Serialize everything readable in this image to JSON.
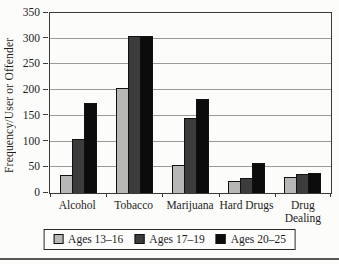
{
  "chart_data": {
    "type": "bar",
    "title": "",
    "ylabel": "Frequency/User or Offender",
    "xlabel": "",
    "ylim": [
      0,
      350
    ],
    "ytick_step": 50,
    "grid": true,
    "legend_position": "bottom",
    "categories": [
      "Alcohol",
      "Tobacco",
      "Marijuana",
      "Hard Drugs",
      "Drug Dealing"
    ],
    "series": [
      {
        "name": "Ages 13–16",
        "color": "#b7b7b5",
        "values": [
          35,
          205,
          55,
          23,
          31
        ]
      },
      {
        "name": "Ages 17–19",
        "color": "#3c3c3c",
        "values": [
          105,
          305,
          145,
          29,
          37
        ]
      },
      {
        "name": "Ages 20–25",
        "color": "#0c0c0c",
        "values": [
          175,
          305,
          183,
          58,
          38
        ]
      }
    ]
  },
  "colors": {
    "background": "#fcfcfb",
    "gridline": "#9a9a9a",
    "axis": "#3a3a3a",
    "bar_border": "#111111",
    "legend_border": "#2a2a2a",
    "bottom_rule": "#565656"
  }
}
